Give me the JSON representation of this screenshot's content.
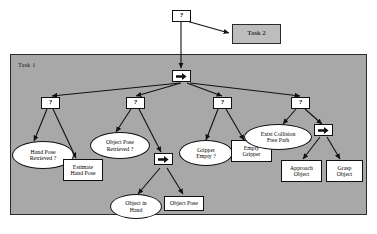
{
  "diagram": {
    "type": "behavior-tree",
    "title_visible": false,
    "colors": {
      "container_fill": "#a8a8a8",
      "container_stroke": "#2b2b2b",
      "node_fill": "#ffffff",
      "node_stroke": "#111111",
      "task2_fill": "#bdbdbd",
      "edge": "#111111",
      "background": "#ffffff"
    },
    "containers": [
      {
        "id": "task1",
        "label": "Task 1"
      }
    ],
    "external_nodes": [
      {
        "id": "task2",
        "label": "Task 2",
        "shape": "rect",
        "fill": "gray"
      }
    ],
    "control_nodes": [
      {
        "id": "root-selector",
        "symbol": "?",
        "kind": "selector"
      },
      {
        "id": "task1-sequence",
        "symbol": "→",
        "kind": "sequence"
      },
      {
        "id": "sel-hand-pose",
        "symbol": "?",
        "kind": "selector"
      },
      {
        "id": "sel-object-pose",
        "symbol": "?",
        "kind": "selector"
      },
      {
        "id": "sel-gripper",
        "symbol": "?",
        "kind": "selector"
      },
      {
        "id": "sel-collision",
        "symbol": "?",
        "kind": "selector"
      },
      {
        "id": "seq-object-pose",
        "symbol": "→",
        "kind": "sequence"
      },
      {
        "id": "seq-grasp",
        "symbol": "→",
        "kind": "sequence"
      }
    ],
    "condition_nodes": [
      {
        "id": "hand-pose-retrieved",
        "label": "Hand Pose Retrieved ?",
        "line1": "Hand Pose",
        "line2": "Retrieved ?",
        "shape": "ellipse"
      },
      {
        "id": "object-pose-retrieved",
        "label": "Object Pose Retrieved ?",
        "line1": "Object Pose",
        "line2": "Retrieved ?",
        "shape": "ellipse"
      },
      {
        "id": "object-in-hand",
        "label": "Object in Hand",
        "line1": "Object in",
        "line2": "Hand",
        "shape": "ellipse"
      },
      {
        "id": "gripper-empty",
        "label": "Gripper Empty ?",
        "line1": "Gripper",
        "line2": "Empty ?",
        "shape": "ellipse"
      },
      {
        "id": "exist-collision-free-path",
        "label": "Exist Collision Free Path",
        "line1": "Exist Collision",
        "line2": "Free Path",
        "shape": "ellipse"
      }
    ],
    "action_nodes": [
      {
        "id": "estimate-hand-pose",
        "label": "Estimate Hand Pose",
        "line1": "Estimate",
        "line2": "Hand Pose",
        "shape": "rect"
      },
      {
        "id": "object-pose",
        "label": "Object Pose",
        "line1": "Object Pose",
        "line2": "",
        "shape": "rect"
      },
      {
        "id": "empty-gripper",
        "label": "Empty Gripper",
        "line1": "Empty",
        "line2": "Gripper",
        "shape": "rect"
      },
      {
        "id": "approach-object",
        "label": "Approach Object",
        "line1": "Approach",
        "line2": "Object",
        "shape": "rect"
      },
      {
        "id": "grasp-object",
        "label": "Grasp Object",
        "line1": "Grasp",
        "line2": "Object",
        "shape": "rect"
      }
    ],
    "edges": [
      {
        "from": "root-selector",
        "to": "task2"
      },
      {
        "from": "root-selector",
        "to": "task1-sequence"
      },
      {
        "from": "task1-sequence",
        "to": "sel-hand-pose"
      },
      {
        "from": "task1-sequence",
        "to": "sel-object-pose"
      },
      {
        "from": "task1-sequence",
        "to": "sel-gripper"
      },
      {
        "from": "task1-sequence",
        "to": "sel-collision"
      },
      {
        "from": "sel-hand-pose",
        "to": "hand-pose-retrieved"
      },
      {
        "from": "sel-hand-pose",
        "to": "estimate-hand-pose"
      },
      {
        "from": "sel-object-pose",
        "to": "object-pose-retrieved"
      },
      {
        "from": "sel-object-pose",
        "to": "seq-object-pose"
      },
      {
        "from": "seq-object-pose",
        "to": "object-in-hand"
      },
      {
        "from": "seq-object-pose",
        "to": "object-pose"
      },
      {
        "from": "sel-gripper",
        "to": "gripper-empty"
      },
      {
        "from": "sel-gripper",
        "to": "empty-gripper"
      },
      {
        "from": "sel-collision",
        "to": "exist-collision-free-path"
      },
      {
        "from": "sel-collision",
        "to": "seq-grasp"
      },
      {
        "from": "seq-grasp",
        "to": "approach-object"
      },
      {
        "from": "seq-grasp",
        "to": "grasp-object"
      }
    ]
  }
}
